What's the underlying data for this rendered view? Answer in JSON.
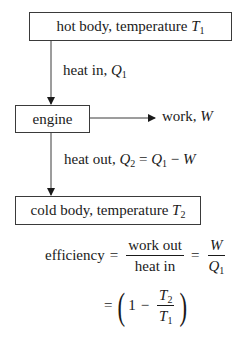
{
  "diagram": {
    "hot_body": {
      "text": "hot body, temperature ",
      "var": "T",
      "sub": "1"
    },
    "heat_in": {
      "text": "heat in, ",
      "var": "Q",
      "sub": "1"
    },
    "engine": {
      "text": "engine"
    },
    "work": {
      "text": "work, ",
      "var": "W"
    },
    "heat_out": {
      "text": "heat out, ",
      "lhs_var": "Q",
      "lhs_sub": "2",
      "eq": " = ",
      "r1_var": "Q",
      "r1_sub": "1",
      "minus": " − ",
      "r2_var": "W"
    },
    "cold_body": {
      "text": "cold body, temperature ",
      "var": "T",
      "sub": "2"
    }
  },
  "formula": {
    "efficiency_label": "efficiency",
    "equals": "=",
    "frac1_num": "work out",
    "frac1_den": "heat in",
    "frac2_num": "W",
    "frac2_den_var": "Q",
    "frac2_den_sub": "1",
    "one": "1",
    "minus": "−",
    "frac3_num_var": "T",
    "frac3_num_sub": "2",
    "frac3_den_var": "T",
    "frac3_den_sub": "1",
    "lparen": "(",
    "rparen": ")"
  }
}
